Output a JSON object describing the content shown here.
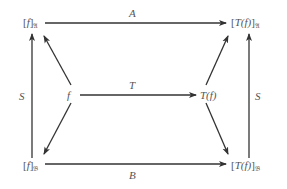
{
  "diagram": {
    "type": "commutative-diagram",
    "nodes": {
      "top_left": {
        "prefix": "[",
        "main": "f",
        "suffix": "]",
        "subscript": "𝔄"
      },
      "top_right": {
        "prefix": "[",
        "main": "T(f)",
        "suffix": "]",
        "subscript": "𝔄"
      },
      "mid_left": {
        "main": "f"
      },
      "mid_right": {
        "main": "T(f)"
      },
      "bottom_left": {
        "prefix": "[",
        "main": "f",
        "suffix": "]",
        "subscript": "𝔅"
      },
      "bottom_right": {
        "prefix": "[",
        "main": "T(f)",
        "suffix": "]",
        "subscript": "𝔅"
      }
    },
    "edges": [
      {
        "from": "top_left",
        "to": "top_right",
        "label": "A"
      },
      {
        "from": "mid_left",
        "to": "mid_right",
        "label": "T"
      },
      {
        "from": "bottom_left",
        "to": "bottom_right",
        "label": "B"
      },
      {
        "from": "bottom_left",
        "to": "top_left",
        "label": "S"
      },
      {
        "from": "bottom_right",
        "to": "top_right",
        "label": "S"
      },
      {
        "from": "mid_left",
        "to": "top_left",
        "label": ""
      },
      {
        "from": "mid_left",
        "to": "bottom_left",
        "label": ""
      },
      {
        "from": "mid_right",
        "to": "top_right",
        "label": ""
      },
      {
        "from": "mid_right",
        "to": "bottom_right",
        "label": ""
      }
    ],
    "labels": {
      "A": "A",
      "T": "T",
      "B": "B",
      "S_left": "S",
      "S_right": "S"
    },
    "colors": {
      "line": "#333333",
      "text": "#555555"
    }
  }
}
